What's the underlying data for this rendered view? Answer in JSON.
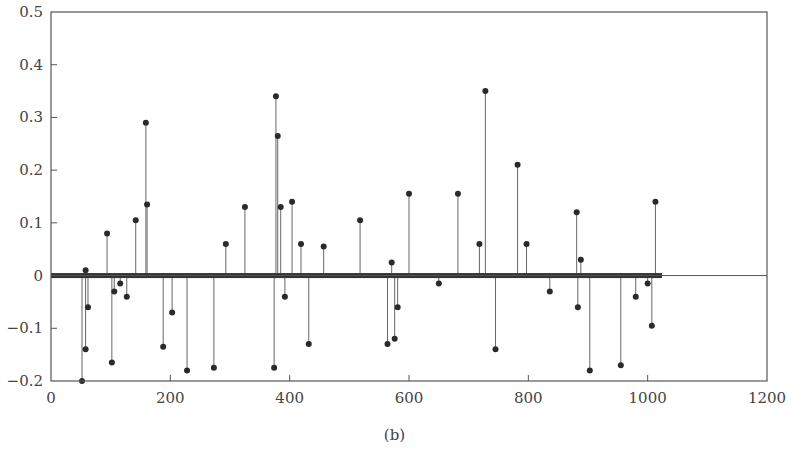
{
  "caption": "(b)",
  "chart_data": {
    "type": "stem",
    "title": "",
    "xlabel": "",
    "ylabel": "",
    "xlim": [
      0,
      1200
    ],
    "ylim": [
      -0.2,
      0.5
    ],
    "xticks": [
      0,
      200,
      400,
      600,
      800,
      1000,
      1200
    ],
    "yticks": [
      -0.2,
      -0.1,
      0,
      0.1,
      0.2,
      0.3,
      0.4,
      0.5
    ],
    "xtick_labels": [
      "0",
      "200",
      "400",
      "600",
      "800",
      "1000",
      "1200"
    ],
    "ytick_labels": [
      "−0.2",
      "−0.1",
      "0",
      "0.1",
      "0.2",
      "0.3",
      "0.4",
      "0.5"
    ],
    "grid": false,
    "legend": null,
    "baseline": {
      "y": 0,
      "dense_zero_samples_x_range": [
        0,
        1024
      ]
    },
    "series": [
      {
        "name": "sparse coefficients",
        "color": "#2a2a2a",
        "points": [
          {
            "x": 52,
            "y": -0.2
          },
          {
            "x": 58,
            "y": 0.01
          },
          {
            "x": 58,
            "y": -0.14
          },
          {
            "x": 62,
            "y": -0.06
          },
          {
            "x": 94,
            "y": 0.08
          },
          {
            "x": 102,
            "y": -0.165
          },
          {
            "x": 106,
            "y": -0.03
          },
          {
            "x": 116,
            "y": -0.015
          },
          {
            "x": 127,
            "y": -0.04
          },
          {
            "x": 142,
            "y": 0.105
          },
          {
            "x": 159,
            "y": 0.29
          },
          {
            "x": 161,
            "y": 0.135
          },
          {
            "x": 188,
            "y": -0.135
          },
          {
            "x": 203,
            "y": -0.07
          },
          {
            "x": 228,
            "y": -0.18
          },
          {
            "x": 273,
            "y": -0.175
          },
          {
            "x": 293,
            "y": 0.06
          },
          {
            "x": 325,
            "y": 0.13
          },
          {
            "x": 374,
            "y": -0.175
          },
          {
            "x": 377,
            "y": 0.34
          },
          {
            "x": 380,
            "y": 0.265
          },
          {
            "x": 385,
            "y": 0.13
          },
          {
            "x": 392,
            "y": -0.04
          },
          {
            "x": 404,
            "y": 0.14
          },
          {
            "x": 419,
            "y": 0.06
          },
          {
            "x": 432,
            "y": -0.13
          },
          {
            "x": 457,
            "y": 0.055
          },
          {
            "x": 518,
            "y": 0.105
          },
          {
            "x": 564,
            "y": -0.13
          },
          {
            "x": 571,
            "y": 0.025
          },
          {
            "x": 576,
            "y": -0.12
          },
          {
            "x": 581,
            "y": -0.06
          },
          {
            "x": 600,
            "y": 0.155
          },
          {
            "x": 650,
            "y": -0.015
          },
          {
            "x": 682,
            "y": 0.155
          },
          {
            "x": 718,
            "y": 0.06
          },
          {
            "x": 728,
            "y": 0.35
          },
          {
            "x": 745,
            "y": -0.14
          },
          {
            "x": 782,
            "y": 0.21
          },
          {
            "x": 797,
            "y": 0.06
          },
          {
            "x": 836,
            "y": -0.03
          },
          {
            "x": 881,
            "y": 0.12
          },
          {
            "x": 883,
            "y": -0.06
          },
          {
            "x": 888,
            "y": 0.03
          },
          {
            "x": 903,
            "y": -0.18
          },
          {
            "x": 955,
            "y": -0.17
          },
          {
            "x": 980,
            "y": -0.04
          },
          {
            "x": 1000,
            "y": -0.015
          },
          {
            "x": 1007,
            "y": -0.095
          },
          {
            "x": 1013,
            "y": 0.14
          }
        ]
      }
    ]
  }
}
